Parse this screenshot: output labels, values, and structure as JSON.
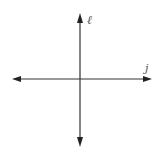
{
  "diagram": {
    "type": "coordinate-axes",
    "vertical_axis": {
      "label": "ℓ",
      "direction": "both"
    },
    "horizontal_axis": {
      "label": "j",
      "direction": "both"
    },
    "colors": {
      "axis": "#333333",
      "label": "#555555",
      "background": "#ffffff"
    }
  }
}
